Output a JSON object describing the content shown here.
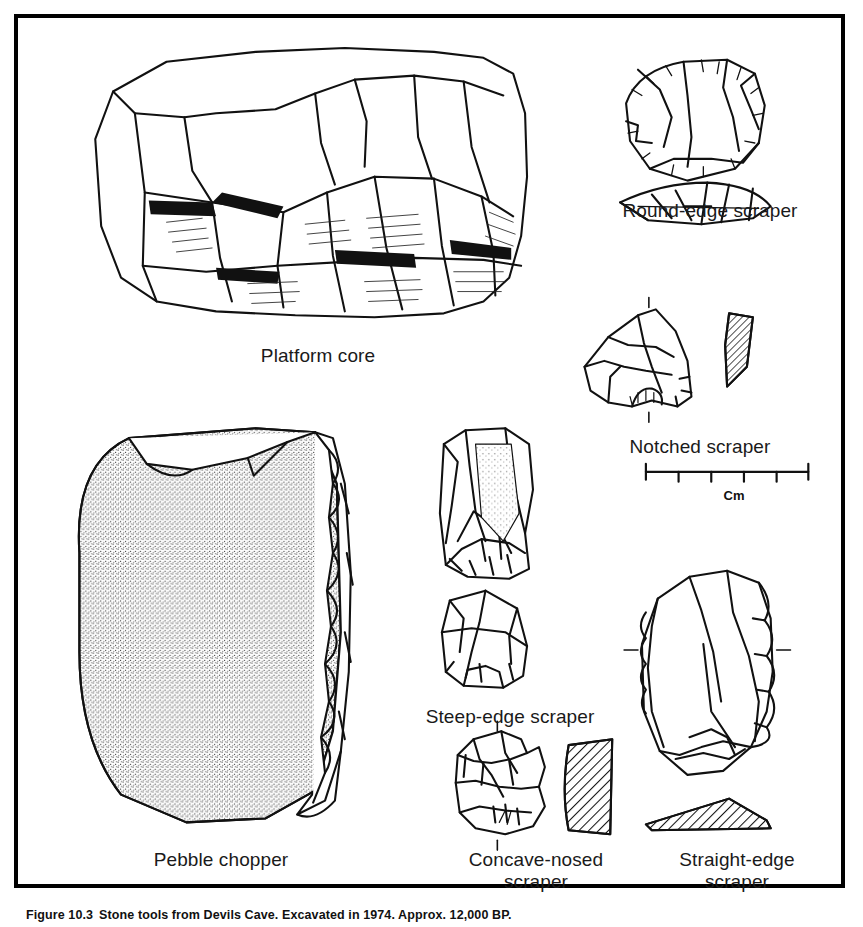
{
  "figure": {
    "caption_number": "Figure 10.3",
    "caption_text": "Stone tools from Devils Cave. Excavated in 1974. Approx. 12,000 BP.",
    "frame_color": "#000000",
    "ink_color": "#111111",
    "background": "#ffffff"
  },
  "scale_bar": {
    "label": "Cm",
    "divisions": 5,
    "total_cm": 5
  },
  "labels": {
    "platform_core": "Platform core",
    "pebble_chopper": "Pebble chopper",
    "round_edge_scraper": "Round-edge scraper",
    "notched_scraper": "Notched scraper",
    "steep_edge_scraper": "Steep-edge scraper",
    "concave_nosed_scraper": "Concave-nosed\nscraper",
    "straight_edge_scraper": "Straight-edge\nscraper"
  },
  "artifacts": [
    {
      "name": "Platform core",
      "views": [
        "dorsal"
      ],
      "shading": "flake-scars-hatched"
    },
    {
      "name": "Pebble chopper",
      "views": [
        "dorsal"
      ],
      "shading": "stippled-cortex"
    },
    {
      "name": "Round-edge scraper",
      "views": [
        "plan",
        "profile"
      ],
      "shading": "outline"
    },
    {
      "name": "Notched scraper",
      "views": [
        "plan",
        "section"
      ],
      "shading": "hatched-section"
    },
    {
      "name": "Steep-edge scraper",
      "views": [
        "upper",
        "lower"
      ],
      "shading": "stippled-outline"
    },
    {
      "name": "Concave-nosed scraper",
      "views": [
        "plan",
        "section"
      ],
      "shading": "hatched-section"
    },
    {
      "name": "Straight-edge scraper",
      "views": [
        "plan",
        "section"
      ],
      "shading": "hatched-section"
    }
  ]
}
